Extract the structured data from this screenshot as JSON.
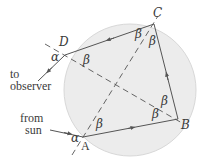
{
  "diagram": {
    "type": "rainbow ray path in a spherical raindrop",
    "circle": {
      "cx": 130,
      "cy": 90,
      "r": 66,
      "fill": "#ececec",
      "stroke": "#d4d4d4"
    },
    "points": {
      "A": {
        "label": "A",
        "x": 83,
        "y": 137
      },
      "B": {
        "label": "B",
        "x": 178,
        "y": 119
      },
      "C": {
        "label": "C",
        "x": 154,
        "y": 24
      },
      "D": {
        "label": "D",
        "x": 65,
        "y": 55
      }
    },
    "angle_labels": {
      "alpha": "α",
      "beta": "β"
    },
    "text_labels": {
      "to_observer_line1": "to",
      "to_observer_line2": "observer",
      "from_sun_line1": "from",
      "from_sun_line2": "sun"
    },
    "colors": {
      "ray": "#555555",
      "dashed": "#555555",
      "text": "#3a3a3a"
    }
  }
}
